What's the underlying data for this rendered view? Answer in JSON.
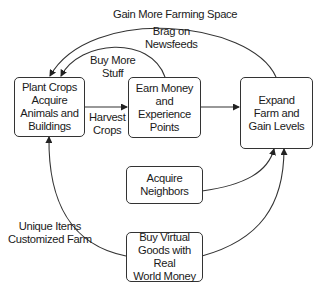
{
  "nodes": {
    "plant": {
      "lines": [
        "Plant Crops",
        "Acquire",
        "Animals and",
        "Buildings"
      ]
    },
    "earn": {
      "lines": [
        "Earn Money",
        "and",
        "Experience",
        "Points"
      ]
    },
    "expand": {
      "lines": [
        "Expand",
        "Farm and",
        "Gain Levels"
      ]
    },
    "neighbors": {
      "lines": [
        "Acquire",
        "Neighbors"
      ]
    },
    "buy": {
      "lines": [
        "Buy Virtual",
        "Goods with Real",
        "World Money"
      ]
    }
  },
  "edges": {
    "gain_space": {
      "label": "Gain More Farming Space",
      "from": "expand",
      "to": "plant"
    },
    "brag": {
      "lines": [
        "Brag on",
        "Newsfeeds"
      ]
    },
    "buy_more": {
      "lines": [
        "Buy More",
        "Stuff"
      ],
      "from": "earn",
      "to": "plant"
    },
    "harvest": {
      "lines": [
        "Harvest",
        "Crops"
      ],
      "from": "plant",
      "to": "earn"
    },
    "earn_to_expand": {
      "from": "earn",
      "to": "expand"
    },
    "neighbors_to_expand": {
      "from": "neighbors",
      "to": "expand"
    },
    "buy_to_expand": {
      "from": "buy",
      "to": "expand"
    },
    "unique": {
      "lines": [
        "Unique Items",
        "Customized Farm"
      ],
      "from": "buy",
      "to": "plant"
    }
  },
  "colors": {
    "stroke": "#333333",
    "text": "#1a1a1a",
    "background": "#ffffff"
  }
}
